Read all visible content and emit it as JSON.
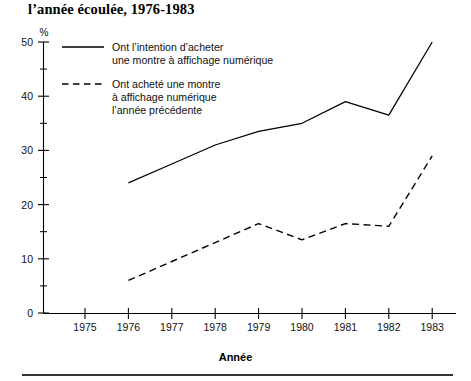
{
  "figure": {
    "title": "l’année écoulée, 1976-1983",
    "xaxis_title": "Année",
    "unit_label": "%"
  },
  "legend": {
    "entries": [
      {
        "style": "solid",
        "lines": [
          "Ont l’intention d’acheter",
          "une montre à affichage numérique"
        ]
      },
      {
        "style": "dashed",
        "lines": [
          "Ont acheté une montre",
          "à affichage numérique",
          "l’année précédente"
        ]
      }
    ]
  },
  "chart_data": {
    "type": "line",
    "title": "l’année écoulée, 1976-1983",
    "xlabel": "Année",
    "ylabel": "%",
    "xlim": [
      1974.5,
      1983.5
    ],
    "ylim": [
      0,
      50
    ],
    "grid": false,
    "legend_position": "inside-top-left",
    "x_ticks": [
      1975,
      1976,
      1977,
      1978,
      1979,
      1980,
      1981,
      1982,
      1983
    ],
    "x_tick_labels": [
      "1975",
      "1976",
      "1977",
      "1978",
      "1979",
      "1980",
      "1981",
      "1982",
      "1983"
    ],
    "y_ticks": [
      0,
      10,
      20,
      30,
      40,
      50
    ],
    "y_tick_labels": [
      "0",
      "10",
      "20",
      "30",
      "40",
      "50"
    ],
    "y_minor_ticks": [
      5,
      15,
      25,
      35,
      45
    ],
    "x": [
      1976,
      1977,
      1978,
      1979,
      1980,
      1981,
      1982,
      1983
    ],
    "series": [
      {
        "name": "Ont l’intention d’acheter une montre à affichage numérique",
        "style": "solid",
        "values": [
          24,
          27.5,
          31,
          33.5,
          35,
          39,
          36.5,
          50
        ]
      },
      {
        "name": "Ont acheté une montre à affichage numérique l’année précédente",
        "style": "dashed",
        "values": [
          6,
          9.5,
          13,
          16.5,
          13.5,
          16.5,
          16,
          29
        ]
      }
    ]
  }
}
